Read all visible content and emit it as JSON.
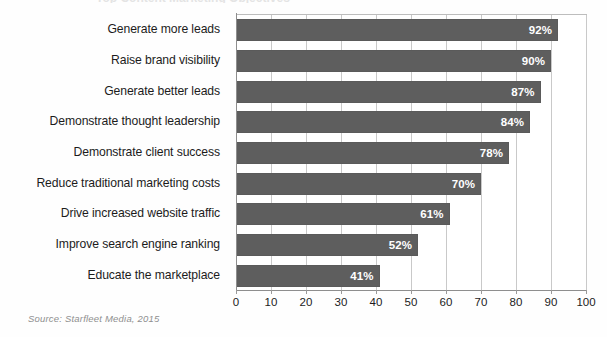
{
  "chart_data": {
    "type": "bar",
    "orientation": "horizontal",
    "title": "",
    "xlabel": "",
    "ylabel": "",
    "xlim": [
      0,
      100
    ],
    "xticks": [
      0,
      10,
      20,
      30,
      40,
      50,
      60,
      70,
      80,
      90,
      100
    ],
    "xtick_labels": [
      "0",
      "10",
      "20",
      "30",
      "40",
      "50",
      "60",
      "70",
      "80",
      "90",
      "100"
    ],
    "grid": true,
    "grid_axis": "x",
    "legend": false,
    "value_suffix": "%",
    "categories": [
      "Generate more leads",
      "Raise brand visibility",
      "Generate better leads",
      "Demonstrate thought leadership",
      "Demonstrate client success",
      "Reduce traditional marketing costs",
      "Drive increased website traffic",
      "Improve search engine ranking",
      "Educate the marketplace"
    ],
    "values": [
      92,
      90,
      87,
      84,
      78,
      70,
      61,
      52,
      41
    ],
    "data_labels": [
      "92%",
      "90%",
      "87%",
      "84%",
      "78%",
      "70%",
      "61%",
      "52%",
      "41%"
    ],
    "colors": {
      "bar_fill": "#5e5e5e",
      "data_label_text": "#ffffff",
      "gridline": "#c9c9c9",
      "axis_line": "#8e8e8e",
      "tick_label_text": "#1c1c1c",
      "category_label_text": "#1c1c1c",
      "background": "#ffffff",
      "source_text": "#8f8f8f"
    }
  },
  "source_note": "Source: Starfleet Media, 2015",
  "title_clipped": "Top Content Marketing Objectives"
}
